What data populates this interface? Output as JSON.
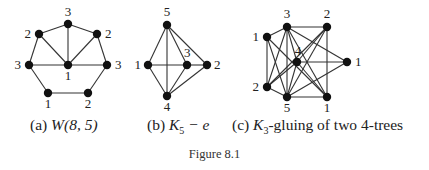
{
  "figure": {
    "label": "Figure 8.1",
    "panels": [
      {
        "id": "a",
        "caption_prefix": "(a) ",
        "caption_math": "W(8, 5)",
        "nodes": [
          {
            "id": "top",
            "x": 68,
            "y": 24,
            "label": "3",
            "lx": 68,
            "ly": 16,
            "anchor": "middle"
          },
          {
            "id": "ul",
            "x": 39,
            "y": 34,
            "label": "2",
            "lx": 31,
            "ly": 38,
            "anchor": "end"
          },
          {
            "id": "ur",
            "x": 97,
            "y": 34,
            "label": "2",
            "lx": 105,
            "ly": 38,
            "anchor": "start"
          },
          {
            "id": "ml",
            "x": 29,
            "y": 65,
            "label": "3",
            "lx": 21,
            "ly": 69,
            "anchor": "end"
          },
          {
            "id": "c",
            "x": 68,
            "y": 65,
            "label": "1",
            "lx": 68,
            "ly": 80,
            "anchor": "middle"
          },
          {
            "id": "mr",
            "x": 107,
            "y": 65,
            "label": "3",
            "lx": 115,
            "ly": 69,
            "anchor": "start"
          },
          {
            "id": "bl",
            "x": 48,
            "y": 93,
            "label": "1",
            "lx": 48,
            "ly": 108,
            "anchor": "middle"
          },
          {
            "id": "br",
            "x": 88,
            "y": 93,
            "label": "2",
            "lx": 88,
            "ly": 108,
            "anchor": "middle"
          }
        ],
        "edges": [
          [
            "top",
            "ul"
          ],
          [
            "top",
            "ur"
          ],
          [
            "ul",
            "ml"
          ],
          [
            "ur",
            "mr"
          ],
          [
            "ml",
            "bl"
          ],
          [
            "mr",
            "br"
          ],
          [
            "bl",
            "br"
          ],
          [
            "c",
            "top"
          ],
          [
            "c",
            "ul"
          ],
          [
            "c",
            "ur"
          ],
          [
            "c",
            "ml"
          ],
          [
            "c",
            "mr"
          ]
        ]
      },
      {
        "id": "b",
        "caption_prefix": "(b) ",
        "caption_math": "K",
        "caption_sub": "5",
        "caption_tail": " − e",
        "nodes": [
          {
            "id": "5",
            "x": 167,
            "y": 25,
            "label": "5",
            "lx": 167,
            "ly": 16,
            "anchor": "middle"
          },
          {
            "id": "1",
            "x": 148,
            "y": 65,
            "label": "1",
            "lx": 141,
            "ly": 69,
            "anchor": "end"
          },
          {
            "id": "3",
            "x": 187,
            "y": 65,
            "label": "3",
            "lx": 184,
            "ly": 57,
            "anchor": "start"
          },
          {
            "id": "2",
            "x": 207,
            "y": 65,
            "label": "2",
            "lx": 214,
            "ly": 69,
            "anchor": "start"
          },
          {
            "id": "4",
            "x": 167,
            "y": 96,
            "label": "4",
            "lx": 167,
            "ly": 111,
            "anchor": "middle"
          }
        ],
        "edges": [
          [
            "5",
            "1"
          ],
          [
            "5",
            "4"
          ],
          [
            "5",
            "3"
          ],
          [
            "5",
            "2"
          ],
          [
            "1",
            "3"
          ],
          [
            "3",
            "2"
          ],
          [
            "1",
            "4"
          ],
          [
            "3",
            "4"
          ],
          [
            "2",
            "4"
          ]
        ]
      },
      {
        "id": "c",
        "caption_prefix": "(c) ",
        "caption_math": "K",
        "caption_sub": "3",
        "caption_tail": "-gluing of two 4-trees",
        "nodes": [
          {
            "id": "1L",
            "x": 267,
            "y": 37,
            "label": "1",
            "lx": 259,
            "ly": 41,
            "anchor": "end"
          },
          {
            "id": "3",
            "x": 287,
            "y": 27,
            "label": "3",
            "lx": 287,
            "ly": 18,
            "anchor": "middle"
          },
          {
            "id": "2T",
            "x": 327,
            "y": 27,
            "label": "2",
            "lx": 327,
            "ly": 18,
            "anchor": "middle"
          },
          {
            "id": "4",
            "x": 297,
            "y": 62,
            "label": "4",
            "lx": 298,
            "ly": 55,
            "anchor": "middle"
          },
          {
            "id": "1R",
            "x": 347,
            "y": 62,
            "label": "1",
            "lx": 355,
            "ly": 66,
            "anchor": "start"
          },
          {
            "id": "2L",
            "x": 267,
            "y": 87,
            "label": "2",
            "lx": 259,
            "ly": 91,
            "anchor": "end"
          },
          {
            "id": "5",
            "x": 287,
            "y": 97,
            "label": "5",
            "lx": 287,
            "ly": 112,
            "anchor": "middle"
          },
          {
            "id": "1B",
            "x": 327,
            "y": 97,
            "label": "1",
            "lx": 327,
            "ly": 112,
            "anchor": "middle"
          }
        ],
        "edges": [
          [
            "1L",
            "3"
          ],
          [
            "1L",
            "2L"
          ],
          [
            "1L",
            "5"
          ],
          [
            "1L",
            "1B"
          ],
          [
            "3",
            "2T"
          ],
          [
            "3",
            "4"
          ],
          [
            "3",
            "1R"
          ],
          [
            "3",
            "2L"
          ],
          [
            "3",
            "5"
          ],
          [
            "3",
            "1B"
          ],
          [
            "2T",
            "4"
          ],
          [
            "2T",
            "5"
          ],
          [
            "2T",
            "1B"
          ],
          [
            "2T",
            "2L"
          ],
          [
            "4",
            "1R"
          ],
          [
            "4",
            "2L"
          ],
          [
            "4",
            "5"
          ],
          [
            "4",
            "1B"
          ],
          [
            "1R",
            "5"
          ],
          [
            "2L",
            "5"
          ],
          [
            "5",
            "1B"
          ]
        ]
      }
    ]
  }
}
